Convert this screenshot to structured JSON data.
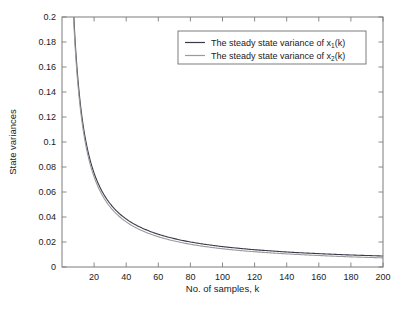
{
  "chart_data": {
    "type": "line",
    "title": "",
    "xlabel": "No. of samples, k",
    "ylabel": "State variances",
    "xlim": [
      0,
      200
    ],
    "ylim": [
      0,
      0.2
    ],
    "grid": false,
    "legend_position": "top-right-inside",
    "xticks": [
      20,
      40,
      60,
      80,
      100,
      120,
      140,
      160,
      180,
      200
    ],
    "xtick_labels": [
      "20",
      "40",
      "60",
      "80",
      "100",
      "120",
      "140",
      "160",
      "180",
      "200"
    ],
    "yticks": [
      0,
      0.02,
      0.04,
      0.06,
      0.08,
      0.1,
      0.12,
      0.14,
      0.16,
      0.18,
      0.2
    ],
    "ytick_labels": [
      "0",
      "0.02",
      "0.04",
      "0.06",
      "0.08",
      "0.1",
      "0.12",
      "0.14",
      "0.16",
      "0.18",
      "0.2"
    ],
    "series": [
      {
        "name": "The steady state variance of x1(k)",
        "label_main": "The steady state variance of x",
        "label_sub": "1",
        "label_tail": "(k)",
        "color": "#3a3a4a",
        "x": [
          1,
          2,
          3,
          4,
          5,
          6,
          7,
          8,
          9,
          10,
          12,
          14,
          16,
          18,
          20,
          25,
          30,
          35,
          40,
          45,
          50,
          60,
          70,
          80,
          90,
          100,
          110,
          120,
          130,
          140,
          150,
          160,
          170,
          180,
          190,
          200
        ],
        "values": [
          1.45,
          0.73,
          0.49,
          0.37,
          0.295,
          0.246,
          0.211,
          0.185,
          0.165,
          0.149,
          0.1245,
          0.1068,
          0.0936,
          0.0833,
          0.0751,
          0.0604,
          0.0506,
          0.0436,
          0.0384,
          0.0343,
          0.0311,
          0.0262,
          0.0227,
          0.02,
          0.018,
          0.0163,
          0.015,
          0.0138,
          0.0129,
          0.012,
          0.0113,
          0.0107,
          0.0101,
          0.0096,
          0.0092,
          0.0088
        ]
      },
      {
        "name": "The steady state variance of x2(k)",
        "label_main": "The steady state variance of x",
        "label_sub": "2",
        "label_tail": "(k)",
        "color": "#9a9a9a",
        "x": [
          1,
          2,
          3,
          4,
          5,
          6,
          7,
          8,
          9,
          10,
          12,
          14,
          16,
          18,
          20,
          25,
          30,
          35,
          40,
          45,
          50,
          60,
          70,
          80,
          90,
          100,
          110,
          120,
          130,
          140,
          150,
          160,
          170,
          180,
          190,
          200
        ],
        "values": [
          1.42,
          0.715,
          0.478,
          0.36,
          0.288,
          0.24,
          0.206,
          0.18,
          0.1605,
          0.1448,
          0.1206,
          0.1032,
          0.0902,
          0.0801,
          0.0721,
          0.0576,
          0.048,
          0.0412,
          0.0361,
          0.0321,
          0.029,
          0.0242,
          0.0208,
          0.0182,
          0.0162,
          0.0146,
          0.0133,
          0.0122,
          0.0113,
          0.0105,
          0.0098,
          0.0092,
          0.0086,
          0.0081,
          0.0077,
          0.0073
        ]
      }
    ]
  },
  "axes": {
    "box_color": "#7d7d7d",
    "background": "#ffffff"
  },
  "legend": {
    "border_color": "#6e6e6e",
    "background": "#ffffff",
    "entries": [
      {
        "label_main": "The steady state variance of x",
        "label_sub": "1",
        "label_tail": "(k)",
        "color": "#3a3a4a"
      },
      {
        "label_main": "The steady state variance of x",
        "label_sub": "2",
        "label_tail": "(k)",
        "color": "#9a9a9a"
      }
    ]
  }
}
